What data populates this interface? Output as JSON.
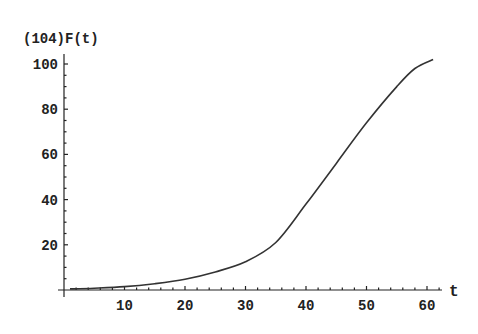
{
  "chart_data": {
    "type": "line",
    "title": "(104)F(t)",
    "xlabel": "t",
    "ylabel": "(104)F(t)",
    "xlim": [
      0,
      62
    ],
    "ylim": [
      0,
      103
    ],
    "x_ticks": [
      10,
      20,
      30,
      40,
      50,
      60
    ],
    "y_ticks": [
      20,
      40,
      60,
      80,
      100
    ],
    "x_tick_labels": [
      "10",
      "20",
      "30",
      "40",
      "50",
      "60"
    ],
    "y_tick_labels": [
      "20",
      "40",
      "60",
      "80",
      "100"
    ],
    "grid": false,
    "legend": null,
    "series": [
      {
        "name": "F(t)",
        "x": [
          1,
          5,
          10,
          15,
          20,
          25,
          30,
          35,
          40,
          45,
          50,
          55,
          58,
          61
        ],
        "values": [
          0.5,
          0.8,
          1.5,
          2.8,
          4.8,
          8,
          12.5,
          21,
          38,
          56,
          74,
          90,
          98,
          102
        ]
      }
    ],
    "colors": {
      "line": "#333333",
      "axis": "#222222",
      "background": "#ffffff"
    }
  }
}
